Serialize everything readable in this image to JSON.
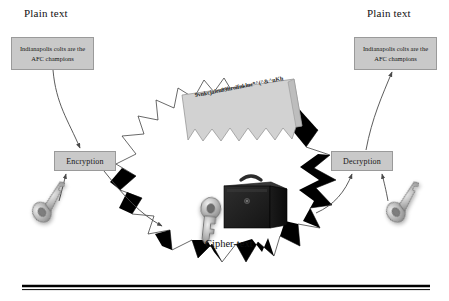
{
  "diagram": {
    "left": {
      "heading": "Plain text",
      "message": "Indianapolis colts are the AFC champions",
      "process_label": "Encryption",
      "key_icon": "key-icon"
    },
    "right": {
      "heading": "Plain text",
      "message": "Indianapolis colts are the AFC champions",
      "process_label": "Decryption",
      "key_icon": "key-icon"
    },
    "center": {
      "cipher_document_text": "9vnkcjaieu89hroifnklnc*^(^&^nKh",
      "caption": "Cipher-text",
      "briefcase_icon": "briefcase-icon",
      "key_icon": "key-icon",
      "burst_shape": "starburst-shape"
    },
    "colors": {
      "box_fill": "#c9c9c9",
      "box_stroke": "#9a9a9a",
      "burst_fill": "#ffffff",
      "burst_accent": "#000000",
      "text": "#111111",
      "rule": "#000000"
    },
    "rule": {
      "name": "bottom-divider"
    }
  }
}
